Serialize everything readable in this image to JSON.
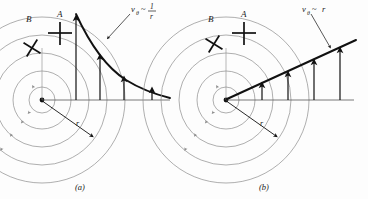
{
  "figure": {
    "name": "vortex-velocity-profiles",
    "background_color": "#fdfdfd",
    "streamline_color": "#8c8c8c",
    "curve_color": "#111111",
    "arrow_color": "#111111",
    "text_color": "#1a1a1a"
  },
  "panels": [
    {
      "id": "a",
      "caption": "(a)",
      "relation_label": "vθ ~ 1/r",
      "relation_numerator": "1",
      "relation_denominator": "r",
      "relation_symbol": "v",
      "relation_subscript": "θ",
      "relation_tilde": "~",
      "profile_type": "hyperbolic-decay",
      "marker_a_label": "A",
      "marker_b_label": "B",
      "radius_label": "r",
      "velocity_arrow_heights": [
        46,
        33,
        21,
        12
      ],
      "velocity_arrow_x": [
        76,
        100,
        124,
        148
      ],
      "streamline_radii": [
        14,
        30,
        48,
        66,
        84
      ],
      "center_x": 40,
      "center_y": 100
    },
    {
      "id": "b",
      "caption": "(b)",
      "relation_label": "vθ ~ r",
      "relation_symbol": "v",
      "relation_subscript": "θ",
      "relation_tilde": "~",
      "relation_tail": "r",
      "profile_type": "linear-growth",
      "marker_a_label": "A",
      "marker_b_label": "B",
      "radius_label": "r",
      "velocity_arrow_heights": [
        12,
        24,
        36,
        48
      ],
      "velocity_arrow_x": [
        76,
        100,
        124,
        148
      ],
      "streamline_radii": [
        14,
        30,
        48,
        66,
        84
      ],
      "center_x": 40,
      "center_y": 100
    }
  ]
}
